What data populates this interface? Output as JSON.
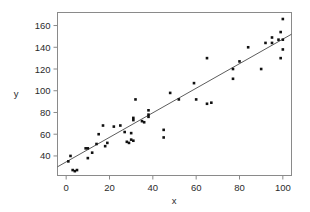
{
  "chart_data": {
    "type": "scatter",
    "title": "",
    "xlabel": "x",
    "ylabel": "y",
    "xlim": [
      -4,
      104
    ],
    "ylim": [
      22,
      172
    ],
    "xticks": [
      0,
      20,
      40,
      60,
      80,
      100
    ],
    "yticks": [
      40,
      60,
      80,
      100,
      120,
      140,
      160
    ],
    "grid": false,
    "legend": null,
    "marker": "filled-square",
    "marker_color": "#111111",
    "line_color": "#4a4a4a",
    "frame_color": "#8a8a8a",
    "points": [
      {
        "x": 1,
        "y": 35
      },
      {
        "x": 2,
        "y": 40
      },
      {
        "x": 3,
        "y": 27
      },
      {
        "x": 4,
        "y": 26
      },
      {
        "x": 5,
        "y": 27
      },
      {
        "x": 9,
        "y": 47
      },
      {
        "x": 10,
        "y": 47
      },
      {
        "x": 10,
        "y": 38
      },
      {
        "x": 12,
        "y": 43
      },
      {
        "x": 14,
        "y": 51
      },
      {
        "x": 15,
        "y": 60
      },
      {
        "x": 17,
        "y": 68
      },
      {
        "x": 18,
        "y": 49
      },
      {
        "x": 19,
        "y": 52
      },
      {
        "x": 22,
        "y": 67
      },
      {
        "x": 25,
        "y": 68
      },
      {
        "x": 27,
        "y": 62
      },
      {
        "x": 28,
        "y": 53
      },
      {
        "x": 29,
        "y": 52
      },
      {
        "x": 30,
        "y": 61
      },
      {
        "x": 30,
        "y": 55
      },
      {
        "x": 31,
        "y": 75
      },
      {
        "x": 31,
        "y": 73
      },
      {
        "x": 31,
        "y": 54
      },
      {
        "x": 32,
        "y": 92
      },
      {
        "x": 35,
        "y": 72
      },
      {
        "x": 36,
        "y": 71
      },
      {
        "x": 38,
        "y": 82
      },
      {
        "x": 38,
        "y": 78
      },
      {
        "x": 38,
        "y": 76
      },
      {
        "x": 45,
        "y": 64
      },
      {
        "x": 45,
        "y": 57
      },
      {
        "x": 48,
        "y": 98
      },
      {
        "x": 52,
        "y": 92
      },
      {
        "x": 59,
        "y": 107
      },
      {
        "x": 60,
        "y": 92
      },
      {
        "x": 65,
        "y": 130
      },
      {
        "x": 65,
        "y": 88
      },
      {
        "x": 67,
        "y": 89
      },
      {
        "x": 77,
        "y": 120
      },
      {
        "x": 77,
        "y": 111
      },
      {
        "x": 80,
        "y": 127
      },
      {
        "x": 84,
        "y": 140
      },
      {
        "x": 90,
        "y": 120
      },
      {
        "x": 92,
        "y": 144
      },
      {
        "x": 95,
        "y": 144
      },
      {
        "x": 95,
        "y": 149
      },
      {
        "x": 98,
        "y": 147
      },
      {
        "x": 99,
        "y": 154
      },
      {
        "x": 99,
        "y": 130
      },
      {
        "x": 100,
        "y": 166
      },
      {
        "x": 100,
        "y": 138
      },
      {
        "x": 100,
        "y": 147
      }
    ],
    "fit_line": {
      "x0": -4,
      "y0": 30,
      "x1": 104,
      "y1": 152
    }
  }
}
